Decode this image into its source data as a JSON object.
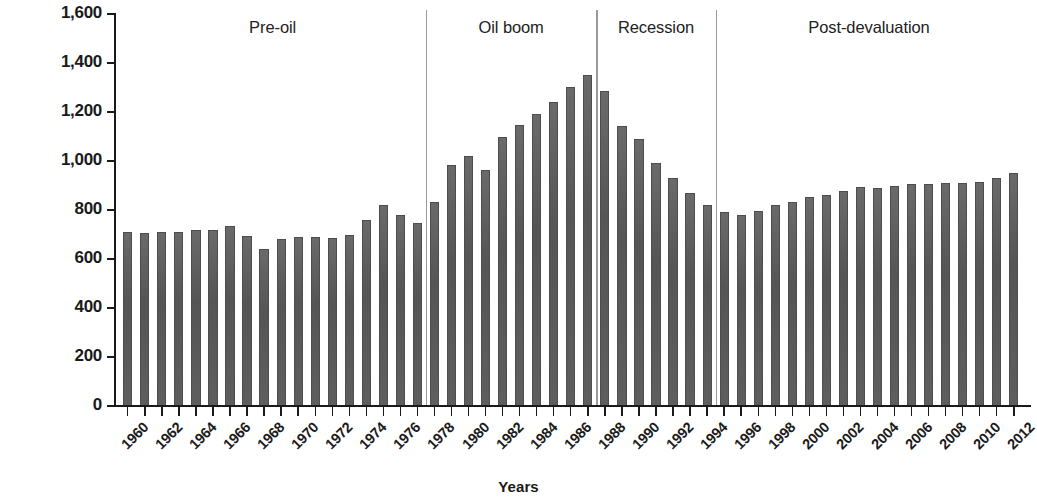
{
  "chart_data": {
    "type": "bar",
    "title": "",
    "xlabel": "Years",
    "ylabel": "GDP per capita in constant 2005 US$",
    "ylim": [
      0,
      1600
    ],
    "ytick_values": [
      0,
      200,
      400,
      600,
      800,
      1000,
      1200,
      1400,
      1600
    ],
    "ytick_labels": [
      "0",
      "200",
      "400",
      "600",
      "800",
      "1,000",
      "1,200",
      "1,400",
      "1,600"
    ],
    "grid": false,
    "legend": null,
    "bar_color": "#5c5c5c",
    "categories": [
      1960,
      1961,
      1962,
      1963,
      1964,
      1965,
      1966,
      1967,
      1968,
      1969,
      1970,
      1971,
      1972,
      1973,
      1974,
      1975,
      1976,
      1977,
      1978,
      1979,
      1980,
      1981,
      1982,
      1983,
      1984,
      1985,
      1986,
      1987,
      1988,
      1989,
      1990,
      1991,
      1992,
      1993,
      1994,
      1995,
      1996,
      1997,
      1998,
      1999,
      2000,
      2001,
      2002,
      2003,
      2004,
      2005,
      2006,
      2007,
      2008,
      2009,
      2010,
      2011,
      2012
    ],
    "xtick_labels": [
      "1960",
      "1962",
      "1964",
      "1966",
      "1968",
      "1970",
      "1972",
      "1974",
      "1976",
      "1978",
      "1980",
      "1982",
      "1984",
      "1986",
      "1988",
      "1990",
      "1992",
      "1994",
      "1996",
      "1998",
      "2000",
      "2002",
      "2004",
      "2006",
      "2008",
      "2010",
      "2012"
    ],
    "values": [
      710,
      705,
      710,
      712,
      720,
      718,
      735,
      695,
      640,
      683,
      688,
      690,
      685,
      700,
      760,
      822,
      780,
      748,
      832,
      985,
      1022,
      965,
      1100,
      1148,
      1192,
      1242,
      1302,
      1350,
      1285,
      1142,
      1090,
      992,
      930,
      870,
      820,
      790,
      778,
      798,
      820,
      832,
      852,
      862,
      878,
      895,
      890,
      900,
      905,
      908,
      912,
      910,
      915,
      930,
      950
    ],
    "periods": [
      {
        "label": "Pre-oil",
        "start_year": 1960,
        "end_year": 1977
      },
      {
        "label": "Oil boom",
        "start_year": 1978,
        "end_year": 1987
      },
      {
        "label": "Recession",
        "start_year": 1988,
        "end_year": 1994
      },
      {
        "label": "Post-devaluation",
        "start_year": 1995,
        "end_year": 2012
      }
    ],
    "divider_years": [
      1977.5,
      1987.5,
      1994.5
    ]
  }
}
